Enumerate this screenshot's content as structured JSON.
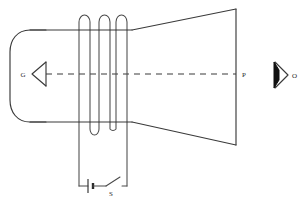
{
  "diagram": {
    "labels": {
      "gun": "G",
      "screen_point": "P",
      "observer": "O",
      "switch": "S"
    },
    "colors": {
      "line": "#3a3a3a",
      "fill_dark": "#111111",
      "background": "#ffffff",
      "text": "#2b2b2b"
    },
    "components": {
      "tube_name": "cathode-ray-tube-envelope",
      "cathode_name": "electron-gun-arrowhead",
      "axis_name": "electron-beam-axis",
      "coil_name": "deflecting-coil",
      "screen_name": "fluorescent-screen",
      "eye_name": "observer-eye",
      "battery_name": "battery-cell",
      "switch_name": "open-switch"
    },
    "geometry": {
      "coil_turn_count": 3,
      "coil_bottom_arc_count": 2,
      "axis_y": 74,
      "tube_top_y": 30,
      "tube_bottom_y": 122,
      "screen_x": 236,
      "screen_top_y": 9,
      "screen_bottom_y": 145
    }
  }
}
